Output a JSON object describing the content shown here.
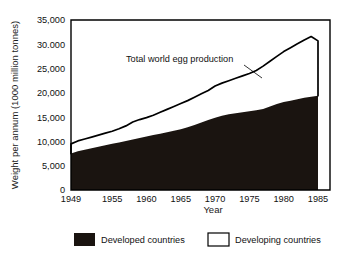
{
  "chart_data": {
    "type": "area",
    "title": "",
    "subtitle": "",
    "xlabel": "Year",
    "ylabel": "Weight per annum (1000 million tonnes)",
    "xlim": [
      1949,
      1985
    ],
    "ylim": [
      0,
      35000
    ],
    "grid": false,
    "stacked": true,
    "legend_position": "bottom",
    "xticks": [
      1949,
      1955,
      1960,
      1965,
      1970,
      1975,
      1980,
      1985
    ],
    "xtick_labels": [
      "1949",
      "1955",
      "1960",
      "1965",
      "1970",
      "1975",
      "1980",
      "1985"
    ],
    "yticks": [
      0,
      5000,
      10000,
      15000,
      20000,
      25000,
      30000,
      35000
    ],
    "ytick_labels": [
      "0",
      "5,000",
      "10,000",
      "15,000",
      "20,000",
      "25,000",
      "30.000",
      "35,000"
    ],
    "x": [
      1949,
      1950,
      1951,
      1952,
      1953,
      1954,
      1955,
      1956,
      1957,
      1958,
      1959,
      1960,
      1961,
      1962,
      1963,
      1964,
      1965,
      1966,
      1967,
      1968,
      1969,
      1970,
      1971,
      1972,
      1973,
      1974,
      1975,
      1976,
      1977,
      1978,
      1979,
      1980,
      1981,
      1982,
      1983,
      1984,
      1985
    ],
    "series": [
      {
        "name": "Developed countries",
        "color": "#1a1410",
        "values": [
          7500,
          8000,
          8300,
          8600,
          8900,
          9200,
          9500,
          9800,
          10100,
          10400,
          10700,
          11000,
          11300,
          11600,
          11900,
          12200,
          12500,
          12900,
          13400,
          13900,
          14400,
          14900,
          15300,
          15600,
          15800,
          16000,
          16200,
          16400,
          16700,
          17200,
          17700,
          18100,
          18400,
          18700,
          19000,
          19200,
          19400
        ]
      },
      {
        "name": "Developing countries",
        "color": "#ffffff",
        "values": [
          2000,
          2100,
          2200,
          2300,
          2400,
          2500,
          2600,
          2800,
          3100,
          3600,
          3800,
          3900,
          4100,
          4400,
          4700,
          5000,
          5300,
          5500,
          5700,
          5900,
          6100,
          6500,
          6700,
          6900,
          7200,
          7500,
          7800,
          8200,
          8800,
          9300,
          9800,
          10400,
          10900,
          11400,
          11900,
          12400,
          11300
        ]
      }
    ],
    "total_series": {
      "name": "Total world egg production",
      "values": [
        9500,
        10100,
        10500,
        10900,
        11300,
        11700,
        12100,
        12600,
        13200,
        14000,
        14500,
        14900,
        15400,
        16000,
        16600,
        17200,
        17800,
        18400,
        19100,
        19800,
        20500,
        21400,
        22000,
        22500,
        23000,
        23500,
        24000,
        24600,
        25500,
        26500,
        27500,
        28500,
        29300,
        30100,
        30900,
        31600,
        30700
      ]
    },
    "annotations": [
      {
        "text": "Total world egg production",
        "x": 1963,
        "y": 26500
      }
    ],
    "legend": [
      {
        "label": "Developed countries",
        "swatch": "filled",
        "color": "#1a1410"
      },
      {
        "label": "Developing countries",
        "swatch": "outline",
        "color": "#ffffff"
      }
    ]
  }
}
